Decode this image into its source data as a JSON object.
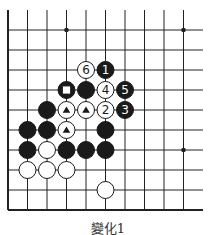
{
  "diagram": {
    "caption": "變化1",
    "board": {
      "origin_x": 8,
      "origin_y": 10,
      "spacing_x": 19.5,
      "spacing_y": 20,
      "columns": 11,
      "rows": 11,
      "right_edge_x": 203,
      "bottom_edge_y": 210,
      "open_top": true,
      "open_right": true,
      "line_color": "#222222",
      "stone_radius": 8.5
    },
    "star_points": [
      {
        "col": 3,
        "row": 1
      },
      {
        "col": 9,
        "row": 1
      },
      {
        "col": 9,
        "row": 7
      }
    ],
    "stones": [
      {
        "color": "white",
        "col": 4,
        "row": 3,
        "label": "6"
      },
      {
        "color": "black",
        "col": 5,
        "row": 3,
        "label": "1"
      },
      {
        "color": "black",
        "col": 3,
        "row": 4,
        "mark": "square"
      },
      {
        "color": "black",
        "col": 4,
        "row": 4
      },
      {
        "color": "white",
        "col": 5,
        "row": 4,
        "label": "4"
      },
      {
        "color": "black",
        "col": 6,
        "row": 4,
        "label": "5"
      },
      {
        "color": "black",
        "col": 2,
        "row": 5
      },
      {
        "color": "white",
        "col": 3,
        "row": 5,
        "mark": "triangle"
      },
      {
        "color": "white",
        "col": 4,
        "row": 5,
        "mark": "triangle"
      },
      {
        "color": "white",
        "col": 5,
        "row": 5,
        "label": "2"
      },
      {
        "color": "black",
        "col": 6,
        "row": 5,
        "label": "3"
      },
      {
        "color": "black",
        "col": 1,
        "row": 6
      },
      {
        "color": "black",
        "col": 2,
        "row": 6
      },
      {
        "color": "white",
        "col": 3,
        "row": 6,
        "mark": "triangle"
      },
      {
        "color": "black",
        "col": 5,
        "row": 6
      },
      {
        "color": "black",
        "col": 1,
        "row": 7
      },
      {
        "color": "white",
        "col": 2,
        "row": 7
      },
      {
        "color": "black",
        "col": 3,
        "row": 7
      },
      {
        "color": "black",
        "col": 4,
        "row": 7
      },
      {
        "color": "black",
        "col": 5,
        "row": 7
      },
      {
        "color": "white",
        "col": 1,
        "row": 8
      },
      {
        "color": "white",
        "col": 2,
        "row": 8
      },
      {
        "color": "white",
        "col": 3,
        "row": 8
      },
      {
        "color": "white",
        "col": 5,
        "row": 9
      }
    ]
  }
}
